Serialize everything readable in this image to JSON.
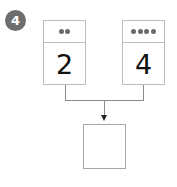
{
  "question_number": "4",
  "cards": [
    {
      "dots": 2,
      "value": "2"
    },
    {
      "dots": 4,
      "value": "4"
    }
  ],
  "answer_box": {
    "value": ""
  },
  "colors": {
    "badge": "#6e6e6e",
    "border": "#bdbdbd",
    "dot": "#6a6a6a",
    "line": "#8a8a8a"
  }
}
